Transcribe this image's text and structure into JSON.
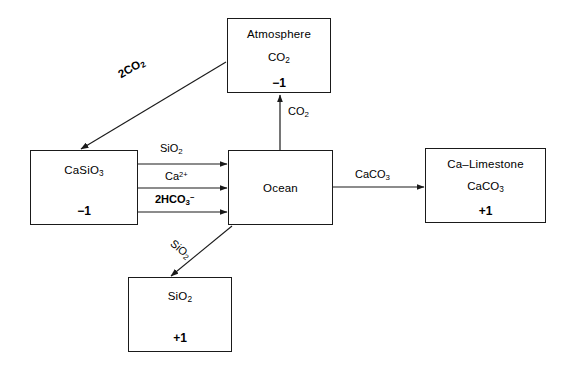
{
  "diagram": {
    "nodes": [
      {
        "id": "atmosphere",
        "title": "Atmosphere",
        "formula_text": "CO2",
        "formula_base": "CO",
        "formula_sub": "2",
        "value": "−1"
      },
      {
        "id": "casio3",
        "title_base": "CaSiO",
        "title_sub": "3",
        "title_text": "CaSiO3",
        "value": "−1"
      },
      {
        "id": "ocean",
        "title": "Ocean",
        "value": ""
      },
      {
        "id": "limestone",
        "title": "Ca–Limestone",
        "formula_text": "CaCO3",
        "formula_base": "CaCO",
        "formula_sub": "3",
        "value": "+1"
      },
      {
        "id": "sio2",
        "title_base": "SiO",
        "title_sub": "2",
        "title_text": "SiO2",
        "value": "+1"
      }
    ],
    "edges": [
      {
        "id": "atmosphere-to-casio3",
        "from": "atmosphere",
        "to": "casio3",
        "label_text": "2CO2",
        "label_base": "2CO",
        "label_sub": "2"
      },
      {
        "id": "ocean-to-atmosphere",
        "from": "ocean",
        "to": "atmosphere",
        "label_text": "CO2",
        "label_base": "CO",
        "label_sub": "2"
      },
      {
        "id": "casio3-to-ocean-sio2",
        "from": "casio3",
        "to": "ocean",
        "label_text": "SiO2",
        "label_base": "SiO",
        "label_sub": "2"
      },
      {
        "id": "casio3-to-ocean-ca",
        "from": "casio3",
        "to": "ocean",
        "label_text": "Ca2+",
        "label_base": "Ca",
        "label_sup": "2+"
      },
      {
        "id": "casio3-to-ocean-hco3",
        "from": "casio3",
        "to": "ocean",
        "label_text": "2HCO3-",
        "label_base": "2HCO",
        "label_sub": "3",
        "label_sup": "−"
      },
      {
        "id": "ocean-to-limestone",
        "from": "ocean",
        "to": "limestone",
        "label_text": "CaCO3",
        "label_base": "CaCO",
        "label_sub": "3"
      },
      {
        "id": "ocean-to-sio2",
        "from": "ocean",
        "to": "sio2",
        "label_text": "SiO2",
        "label_base": "SiO",
        "label_sub": "2"
      }
    ],
    "colors": {
      "stroke": "#1a1a1a",
      "text": "#000000",
      "background": "#ffffff"
    }
  }
}
